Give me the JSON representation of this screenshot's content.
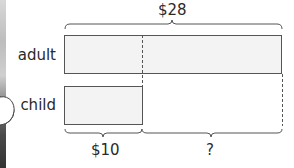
{
  "diagram": {
    "type": "bar-model",
    "total_label": "$28",
    "rows": [
      {
        "name": "adult",
        "label": "adult"
      },
      {
        "name": "child",
        "label": "child"
      }
    ],
    "segments": [
      {
        "name": "child-amount",
        "label": "$10"
      },
      {
        "name": "unknown-difference",
        "label": "?"
      }
    ],
    "colors": {
      "bar_fill": "#f3f3f3",
      "bar_stroke": "#555555",
      "brace_stroke": "#555555",
      "dash_stroke": "#555555",
      "text": "#2a2a2a"
    }
  }
}
